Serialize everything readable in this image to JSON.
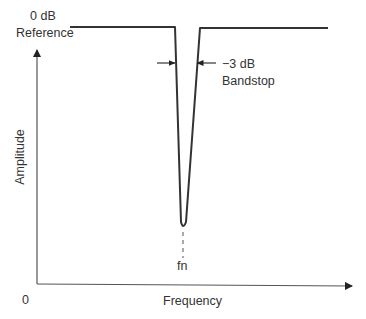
{
  "diagram": {
    "type": "bandstop-filter-response",
    "labels": {
      "reference_line1": "0 dB",
      "reference_line2": "Reference",
      "bandstop_line1": "−3 dB",
      "bandstop_line2": "Bandstop",
      "y_axis": "Amplitude",
      "x_axis": "Frequency",
      "origin": "0",
      "notch_frequency": "fn"
    },
    "colors": {
      "curve": "#333333",
      "axis": "#555555",
      "text": "#333333"
    }
  }
}
